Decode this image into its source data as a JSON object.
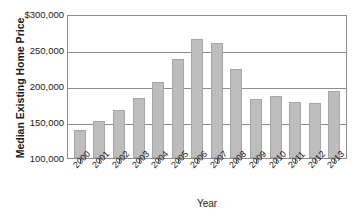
{
  "chart_data": {
    "type": "bar",
    "title": "",
    "xlabel": "Year",
    "ylabel": "Median Existing Home Price",
    "categories": [
      "2000",
      "2001",
      "2002",
      "2003",
      "2004",
      "2005",
      "2006",
      "2007",
      "2008",
      "2009",
      "2010",
      "2011",
      "2012",
      "2013"
    ],
    "values": [
      139000,
      152000,
      166000,
      184000,
      205000,
      238000,
      265000,
      260000,
      224000,
      182000,
      186000,
      178000,
      176000,
      193000
    ],
    "ylim": [
      100000,
      300000
    ],
    "ytick_values": [
      300000,
      250000,
      200000,
      150000,
      100000
    ],
    "ytick_labels": [
      "$300,000",
      "250,000",
      "200,000",
      "150,000",
      "100,000"
    ],
    "grid": true,
    "legend": "none",
    "bar_color": "#bdbdbd",
    "bar_border_color": "#a6a6a6",
    "axis_color": "#8c8c8c",
    "text_color": "#1a1a1a"
  }
}
